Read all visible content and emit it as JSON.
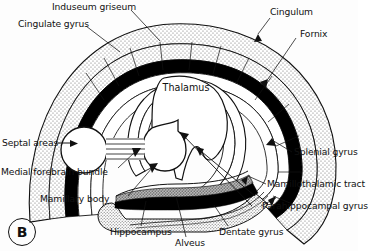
{
  "figure": {
    "panel_letter": "B",
    "title_text": "",
    "background_color": "#fdfdfd",
    "ink_color": "#111111",
    "stipple_color": "#8a8a8a",
    "band_black": "#000000",
    "band_gray": "#8c8c8c"
  },
  "labels": [
    {
      "id": "induseum-griseum",
      "text": "Induseum griseum",
      "x": 52,
      "y": 2,
      "anchor": "start"
    },
    {
      "id": "cingulate-gyrus",
      "text": "Cingulate gyrus",
      "x": 20,
      "y": 19,
      "anchor": "start"
    },
    {
      "id": "cingulum",
      "text": "Cingulum",
      "x": 268,
      "y": 9,
      "anchor": "start"
    },
    {
      "id": "fornix",
      "text": "Fornix",
      "x": 297,
      "y": 30,
      "anchor": "start"
    },
    {
      "id": "thalamus",
      "text": "Thalamus",
      "x": 181,
      "y": 86,
      "anchor": "middle"
    },
    {
      "id": "septal-areas",
      "text": "Septal areas",
      "x": 4,
      "y": 139,
      "anchor": "start"
    },
    {
      "id": "medial-forebrain-bundle",
      "text": "Medial forebrain bundle",
      "x": 2,
      "y": 173,
      "anchor": "start"
    },
    {
      "id": "mamillary-body",
      "text": "Mamillary body",
      "x": 42,
      "y": 196,
      "anchor": "start"
    },
    {
      "id": "splenial-gyrus",
      "text": "Splenial gyrus",
      "x": 295,
      "y": 153,
      "anchor": "start"
    },
    {
      "id": "mamillothalamic-tract",
      "text": "Mamillothalamic tract",
      "x": 268,
      "y": 186,
      "anchor": "start"
    },
    {
      "id": "parahippocampal-gyrus",
      "text": "Parahippocampal gyrus",
      "x": 263,
      "y": 208,
      "anchor": "start"
    },
    {
      "id": "hippocampus",
      "text": "Hippocampus",
      "x": 111,
      "y": 230,
      "anchor": "start"
    },
    {
      "id": "alveus",
      "text": "Alveus",
      "x": 176,
      "y": 241,
      "anchor": "start"
    },
    {
      "id": "dentate-gyrus",
      "text": "Dentate gyrus",
      "x": 220,
      "y": 230,
      "anchor": "start"
    }
  ],
  "anatomy": {
    "structures": [
      "cingulate gyrus band (stippled)",
      "induseum griseum line",
      "cingulum (thick black band)",
      "fornix (inner white band)",
      "thalamus (central body)",
      "septal area (left circle)",
      "mamillary body (right circle)",
      "medial forebrain bundle (striped connector)",
      "hippocampus (gray band)",
      "alveus (black band)",
      "dentate gyrus",
      "parahippocampal gyrus (stippled)",
      "splenial gyrus",
      "mamillothalamic tract"
    ]
  }
}
